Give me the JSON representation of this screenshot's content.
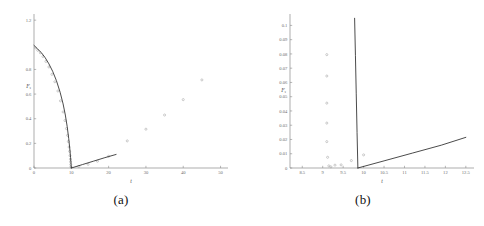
{
  "figure": {
    "panels": [
      {
        "id": "a",
        "caption": "(a)",
        "xlabel": "t",
        "ylabel": "F",
        "ylabel_sub": "s"
      },
      {
        "id": "b",
        "caption": "(b)",
        "xlabel": "t",
        "ylabel": "F",
        "ylabel_sub": "s"
      }
    ]
  },
  "chart_data": [
    {
      "type": "scatter",
      "panel": "a",
      "title": "",
      "xlabel": "t",
      "ylabel": "F_s",
      "xlim": [
        0,
        52
      ],
      "ylim": [
        0,
        1.25
      ],
      "xticks": [
        0,
        10,
        20,
        30,
        40,
        50
      ],
      "xtick_labels": [
        "0",
        "10",
        "20",
        "30",
        "40",
        "50"
      ],
      "yticks": [
        0,
        0.2,
        0.4,
        0.6,
        0.8,
        1.2
      ],
      "ytick_labels": [
        "0",
        "0.2",
        "0.4",
        "0.6",
        "0.8",
        "1.2"
      ],
      "grid": false,
      "legend": false,
      "series": [
        {
          "name": "data-points-descending",
          "kind": "scatter",
          "marker": "open-circle",
          "x": [
            0.4,
            1.0,
            1.7,
            2.4,
            3.2,
            4.0,
            4.8,
            5.6,
            6.4,
            7.1,
            7.8,
            8.3,
            8.7,
            9.0,
            9.2,
            9.4,
            9.55,
            9.65,
            9.75,
            9.8,
            9.85,
            9.9
          ],
          "y": [
            0.975,
            0.955,
            0.935,
            0.905,
            0.865,
            0.82,
            0.76,
            0.7,
            0.625,
            0.545,
            0.455,
            0.385,
            0.32,
            0.265,
            0.215,
            0.17,
            0.135,
            0.1,
            0.072,
            0.05,
            0.028,
            0.01
          ]
        },
        {
          "name": "data-points-ascending",
          "kind": "scatter",
          "marker": "open-circle",
          "x": [
            12.0,
            14.5,
            17.0,
            20.0,
            25.0,
            30.0,
            35.0,
            40.0,
            45.0
          ],
          "y": [
            0.012,
            0.03,
            0.055,
            0.095,
            0.22,
            0.315,
            0.43,
            0.555,
            0.715
          ]
        },
        {
          "name": "theory-curve-descending",
          "kind": "line",
          "x": [
            0.0,
            1.0,
            2.0,
            3.0,
            4.0,
            5.0,
            6.0,
            7.0,
            7.8,
            8.4,
            8.9,
            9.3,
            9.6,
            9.8,
            9.9,
            9.95,
            10.0
          ],
          "y": [
            0.995,
            0.965,
            0.935,
            0.895,
            0.845,
            0.785,
            0.71,
            0.615,
            0.52,
            0.43,
            0.335,
            0.24,
            0.155,
            0.085,
            0.045,
            0.02,
            0.0
          ]
        },
        {
          "name": "theory-curve-ascending",
          "kind": "line",
          "x": [
            10.0,
            13.0,
            16.0,
            19.0,
            22.0
          ],
          "y": [
            0.0,
            0.028,
            0.056,
            0.084,
            0.11
          ]
        }
      ]
    },
    {
      "type": "scatter",
      "panel": "b",
      "title": "",
      "xlabel": "t",
      "ylabel": "F_s",
      "xlim": [
        8.2,
        12.7
      ],
      "ylim": [
        0,
        0.108
      ],
      "xticks": [
        8.5,
        9,
        9.5,
        10,
        10.5,
        11,
        11.5,
        12,
        12.5
      ],
      "xtick_labels": [
        "8.5",
        "9",
        "9.5",
        "10",
        "10.5",
        "11",
        "11.5",
        "12",
        "12.5"
      ],
      "yticks": [
        0,
        0.01,
        0.02,
        0.03,
        0.04,
        0.05,
        0.06,
        0.07,
        0.08,
        0.09,
        0.1
      ],
      "ytick_labels": [
        "0",
        "0.01",
        "0.02",
        "0.03",
        "0.04",
        "0.05",
        "0.06",
        "0.07",
        "0.08",
        "0.09",
        "0.1"
      ],
      "grid": false,
      "legend": false,
      "series": [
        {
          "name": "data-points-column",
          "kind": "scatter",
          "marker": "open-circle",
          "x": [
            9.1,
            9.1,
            9.1,
            9.1,
            9.1,
            9.12,
            9.15,
            9.2,
            9.3,
            9.45,
            9.7,
            10.0
          ],
          "y": [
            0.0795,
            0.0645,
            0.0455,
            0.0315,
            0.0185,
            0.0075,
            0.0015,
            0.0008,
            0.002,
            0.0022,
            0.0052,
            0.0092
          ]
        },
        {
          "name": "theory-curve-descending",
          "kind": "line",
          "x": [
            9.78,
            9.8,
            9.82,
            9.84,
            9.86
          ],
          "y": [
            0.105,
            0.079,
            0.052,
            0.025,
            0.0
          ]
        },
        {
          "name": "theory-curve-ascending",
          "kind": "line",
          "x": [
            9.86,
            10.5,
            11.2,
            11.9,
            12.5
          ],
          "y": [
            0.0,
            0.005,
            0.0105,
            0.016,
            0.0215
          ]
        }
      ]
    }
  ]
}
